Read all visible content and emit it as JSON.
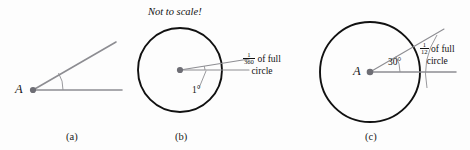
{
  "figure": {
    "background_color": "#fdfdfd",
    "ink_color": "#111111",
    "ray_color": "#8d8d92",
    "circle_color": "#111111",
    "panels": [
      {
        "id": "a",
        "label": "(a)",
        "vertex_label": "A",
        "angle_text": "",
        "note": "",
        "callout_numerator": "",
        "callout_denominator": "",
        "callout_text": "",
        "callout_text_line2": ""
      },
      {
        "id": "b",
        "label": "(b)",
        "vertex_label": "",
        "angle_text": "1°",
        "note": "Not to scale!",
        "callout_numerator": "1",
        "callout_denominator": "360",
        "callout_text": "of full",
        "callout_text_line2": "circle"
      },
      {
        "id": "c",
        "label": "(c)",
        "vertex_label": "A",
        "angle_text": "30°",
        "note": "",
        "callout_numerator": "1",
        "callout_denominator": "12",
        "callout_text": "of full",
        "callout_text_line2": "circle"
      }
    ]
  }
}
